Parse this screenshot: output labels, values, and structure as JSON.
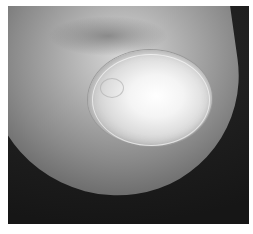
{
  "image": {
    "description": "Grayscale clinical photograph of a fingertip showing a nail with whitened surface and surrounding cuticle",
    "subject": "fingernail",
    "colors": {
      "background": "#1c1c1c",
      "skin": "#a9a9a9",
      "nail_highlight": "#ffffff",
      "frame": "#ffffff"
    }
  }
}
